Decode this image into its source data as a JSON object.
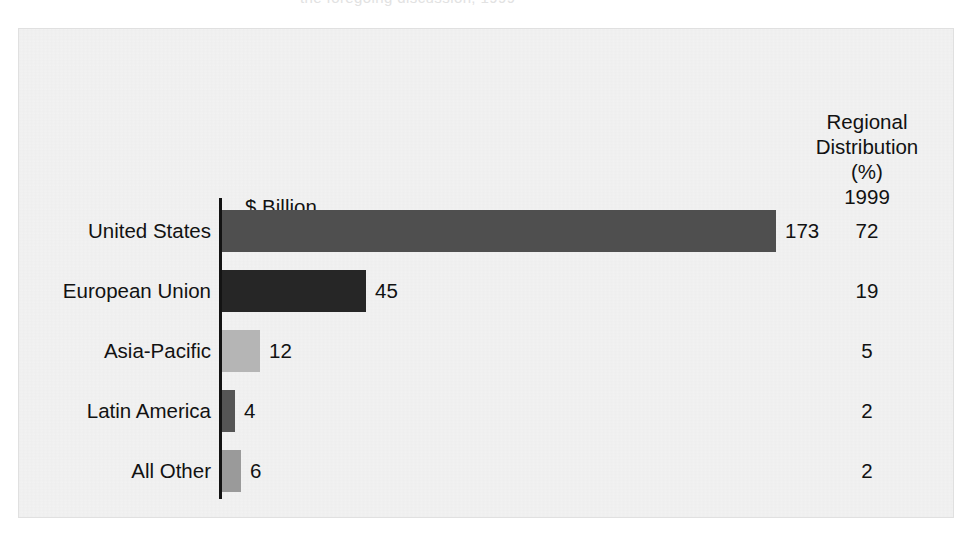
{
  "page": {
    "top_bleed_text": "the foregoing discussion, 1999"
  },
  "chart_data": {
    "type": "bar",
    "orientation": "horizontal",
    "title": "",
    "xlabel": "$ Billion",
    "ylabel": "",
    "value_axis_caption": "$ Billion",
    "right_header": {
      "line1": "Regional",
      "line2": "Distribution",
      "line3": "(%)",
      "line4": "1999"
    },
    "categories": [
      "United States",
      "European Union",
      "Asia-Pacific",
      "Latin America",
      "All Other"
    ],
    "values": [
      173,
      45,
      12,
      4,
      6
    ],
    "value_labels": [
      "173",
      "45",
      "12",
      "4",
      "6"
    ],
    "share_percent": [
      72,
      19,
      5,
      2,
      2
    ],
    "share_labels": [
      "72",
      "19",
      "5",
      "2",
      "2"
    ],
    "bar_colors": [
      "#4f4f4f",
      "#262626",
      "#b5b5b5",
      "#555555",
      "#9a9a9a"
    ],
    "xlim": [
      0,
      173
    ],
    "grid": false,
    "legend": "none",
    "axis_color": "#131313",
    "background": "#f2f2f2",
    "text_color": "#121212"
  },
  "ghost": {
    "left": "bleed-through text from reverse side of page",
    "mid": "faint offset printing visible through paper"
  }
}
